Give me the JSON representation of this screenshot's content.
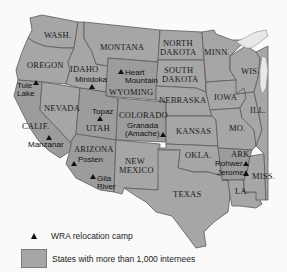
{
  "map": {
    "colors": {
      "state_fill": "#a6a6a6",
      "state_fill_dark": "#9a9a9a",
      "border": "#5a5a5a",
      "water": "#e8e8e8",
      "background": "#fafafa",
      "camp_marker": "#111111"
    },
    "states": {
      "wash": "WASH.",
      "oregon": "OREGON",
      "calif": "CALIF.",
      "nevada": "NEVADA",
      "idaho": "IDAHO",
      "montana": "MONTANA",
      "wyoming": "WYOMING",
      "utah": "UTAH",
      "arizona": "ARIZONA",
      "colorado": "COLORADO",
      "new": "NEW",
      "mexico": "MEXICO",
      "north": "NORTH",
      "dakota_n": "DAKOTA",
      "south": "SOUTH",
      "dakota_s": "DAKOTA",
      "nebraska": "NEBRASKA",
      "kansas": "KANSAS",
      "okla": "OKLA.",
      "texas": "TEXAS",
      "minn": "MINN.",
      "iowa": "IOWA",
      "mo": "MO.",
      "ark": "ARK.",
      "la": "LA.",
      "wis": "WIS.",
      "ill": "ILL.",
      "miss": "MISS."
    },
    "camps": {
      "tule_1": "Tule",
      "tule_2": "Lake",
      "minidoka": "Minidoka",
      "heart_1": "Heart",
      "heart_2": "Mountain",
      "topaz": "Topaz",
      "manzanar": "Manzanar",
      "granada_1": "Granada",
      "granada_2": "(Amache)",
      "posten": "Posten",
      "gila_1": "Gila",
      "gila_2": "River",
      "rohwer": "Rohwer",
      "jerome": "Jerome"
    }
  },
  "legend": {
    "camp_label": "WRA relocation camp",
    "states_label": "States with more than 1,000 internees"
  }
}
